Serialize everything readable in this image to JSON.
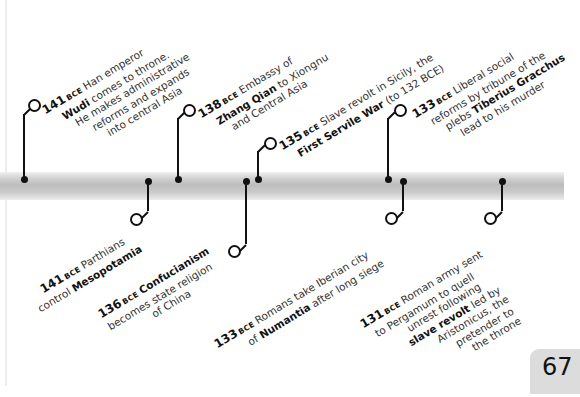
{
  "timeline": {
    "bar_color": "#c4c4c4",
    "ink_color": "#111111",
    "era_label": "BCE",
    "events_above": [
      {
        "year": "141",
        "era": "BCE",
        "lines": [
          [
            "",
            "Han emperor"
          ],
          [
            "Wudi",
            " comes to throne."
          ],
          [
            "",
            "He makes administrative"
          ],
          [
            "",
            "reforms and expands"
          ],
          [
            "",
            "into central Asia"
          ]
        ]
      },
      {
        "year": "138",
        "era": "BCE",
        "lines": [
          [
            "",
            "Embassy of"
          ],
          [
            "Zhang Qian",
            " to Xiongnu"
          ],
          [
            "",
            "and Central Asia"
          ]
        ]
      },
      {
        "year": "135",
        "era": "BCE",
        "lines": [
          [
            "",
            "Slave revolt in Sicily, the"
          ],
          [
            "First Servile War",
            " (to 132 BCE)"
          ]
        ]
      },
      {
        "year": "133",
        "era": "BCE",
        "lines": [
          [
            "",
            "Liberal social"
          ],
          [
            "",
            "reforms by tribune of the"
          ],
          [
            "",
            "plebs "
          ],
          [
            "Tiberius Gracchus",
            ""
          ],
          [
            "",
            "lead to his murder"
          ]
        ]
      }
    ],
    "events_below": [
      {
        "year": "141",
        "era": "BCE",
        "lines": [
          [
            "",
            "Parthians"
          ],
          [
            "",
            "control "
          ],
          [
            "Mesopotamia",
            ""
          ]
        ]
      },
      {
        "year": "136",
        "era": "BCE",
        "lines": [
          [
            "Confucianism",
            ""
          ],
          [
            "",
            "becomes state religion"
          ],
          [
            "",
            "of China"
          ]
        ]
      },
      {
        "year": "133",
        "era": "BCE",
        "lines": [
          [
            "",
            "Romans take Iberian city"
          ],
          [
            "",
            "of "
          ],
          [
            "Numantia",
            " after long siege"
          ]
        ]
      },
      {
        "year": "131",
        "era": "BCE",
        "lines": [
          [
            "",
            "Roman army sent"
          ],
          [
            "",
            "to Pergamum to quell"
          ],
          [
            "",
            "unrest following"
          ],
          [
            "slave revolt",
            " led by"
          ],
          [
            "",
            "Aristonicus, the"
          ],
          [
            "",
            "pretender to"
          ],
          [
            "",
            "the throne"
          ]
        ]
      }
    ]
  },
  "texts": {
    "a0_year": "141",
    "a0_era": "BCE",
    "a0_l1": "Han emperor",
    "a0_b2": "Wudi",
    "a0_l2": " comes to throne.",
    "a0_l3": "He makes administrative",
    "a0_l4": "reforms and expands",
    "a0_l5": "into central Asia",
    "a1_year": "138",
    "a1_era": "BCE",
    "a1_l1": "Embassy of",
    "a1_b2": "Zhang Qian",
    "a1_l2": " to Xiongnu",
    "a1_l3": "and Central Asia",
    "a2_year": "135",
    "a2_era": "BCE",
    "a2_l1": "Slave revolt in Sicily, the",
    "a2_b2": "First Servile War",
    "a2_l2": " (to 132 BCE)",
    "a3_year": "133",
    "a3_era": "BCE",
    "a3_l1": "Liberal social",
    "a3_l2": "reforms by tribune of the",
    "a3_l3": "plebs ",
    "a3_b3": "Tiberius Gracchus",
    "a3_l4": "lead to his murder",
    "b0_year": "141",
    "b0_era": "BCE",
    "b0_l1": "Parthians",
    "b0_l2": "control ",
    "b0_b2": "Mesopotamia",
    "b1_year": "136",
    "b1_era": "BCE",
    "b1_b1": "Confucianism",
    "b1_l2": "becomes state religion",
    "b1_l3": "of China",
    "b2_year": "133",
    "b2_era": "BCE",
    "b2_l1": "Romans take Iberian city",
    "b2_l2": "of ",
    "b2_b2": "Numantia",
    "b2_l2b": " after long siege",
    "b3_year": "131",
    "b3_era": "BCE",
    "b3_l1": "Roman army sent",
    "b3_l2": "to Pergamum to quell",
    "b3_l3": "unrest following",
    "b3_b4": "slave revolt",
    "b3_l4": " led by",
    "b3_l5": "Aristonicus, the",
    "b3_l6": "pretender to",
    "b3_l7": "the throne"
  },
  "page": {
    "number": "67"
  }
}
